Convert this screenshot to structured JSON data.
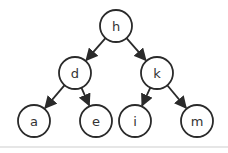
{
  "diagram": {
    "type": "binary-tree",
    "colors": {
      "stroke": "#2a2a2a",
      "fill": "#ffffff",
      "text": "#333333",
      "divider": "#e6e6e6"
    },
    "nodes": [
      {
        "id": "h",
        "label": "h",
        "cx": 116,
        "cy": 26
      },
      {
        "id": "d",
        "label": "d",
        "cx": 75,
        "cy": 73
      },
      {
        "id": "k",
        "label": "k",
        "cx": 157,
        "cy": 73
      },
      {
        "id": "a",
        "label": "a",
        "cx": 34,
        "cy": 121
      },
      {
        "id": "e",
        "label": "e",
        "cx": 96,
        "cy": 121
      },
      {
        "id": "i",
        "label": "i",
        "cx": 135,
        "cy": 121
      },
      {
        "id": "m",
        "label": "m",
        "cx": 197,
        "cy": 121
      }
    ],
    "edges": [
      {
        "from": "h",
        "to": "d"
      },
      {
        "from": "h",
        "to": "k"
      },
      {
        "from": "d",
        "to": "a"
      },
      {
        "from": "d",
        "to": "e"
      },
      {
        "from": "k",
        "to": "i"
      },
      {
        "from": "k",
        "to": "m"
      }
    ]
  }
}
